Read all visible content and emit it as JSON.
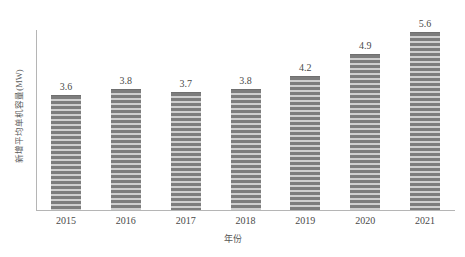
{
  "chart_data": {
    "type": "bar",
    "title": "",
    "categories": [
      "2015",
      "2016",
      "2017",
      "2018",
      "2019",
      "2020",
      "2021"
    ],
    "values": [
      3.6,
      3.8,
      3.7,
      3.8,
      4.2,
      4.9,
      5.6
    ],
    "data_labels": [
      "3.6",
      "3.8",
      "3.7",
      "3.8",
      "4.2",
      "4.9",
      "5.6"
    ],
    "xlabel": "年份",
    "ylabel": "新增平均单机容量(MW)",
    "ylim": [
      0,
      5.65
    ],
    "xlim": null,
    "grid": false,
    "legend": null,
    "y_tick_labels": [],
    "series": [
      {
        "name": "新增平均单机容量(MW)",
        "values": [
          3.6,
          3.8,
          3.7,
          3.8,
          4.2,
          4.9,
          5.6
        ]
      }
    ]
  },
  "colors": {
    "bar_stripe_dark": "#7d7d7d",
    "bar_stripe_light": "#cfcfcf",
    "axis_line": "#b5b5b5",
    "label_text": "#4a4a4a",
    "background": "#ffffff"
  },
  "footer": {
    "caption": ""
  }
}
